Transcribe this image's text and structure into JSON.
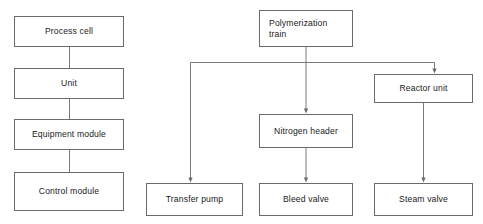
{
  "figure": {
    "kind": "block-diagram",
    "top_cut_caption": "",
    "box_border_color": "#6a6a6a",
    "line_color": "#7a7a7a",
    "text_color": "#1a1a1a",
    "background_color": "#ffffff"
  },
  "hierarchy_column": {
    "label": "physical-model-hierarchy",
    "nodes": [
      {
        "id": "process-cell",
        "label": "Process cell"
      },
      {
        "id": "unit",
        "label": "Unit"
      },
      {
        "id": "equipment-module",
        "label": "Equipment module"
      },
      {
        "id": "control-module",
        "label": "Control module"
      }
    ]
  },
  "example_tree": {
    "label": "polymerization-example",
    "root": {
      "id": "polymerization-train",
      "line1": "Polymerization",
      "line2": "train"
    },
    "nodes": [
      {
        "id": "reactor-unit",
        "label": "Reactor unit"
      },
      {
        "id": "nitrogen-header",
        "label": "Nitrogen header"
      },
      {
        "id": "transfer-pump",
        "label": "Transfer pump"
      },
      {
        "id": "bleed-valve",
        "label": "Bleed valve"
      },
      {
        "id": "steam-valve",
        "label": "Steam valve"
      }
    ]
  }
}
